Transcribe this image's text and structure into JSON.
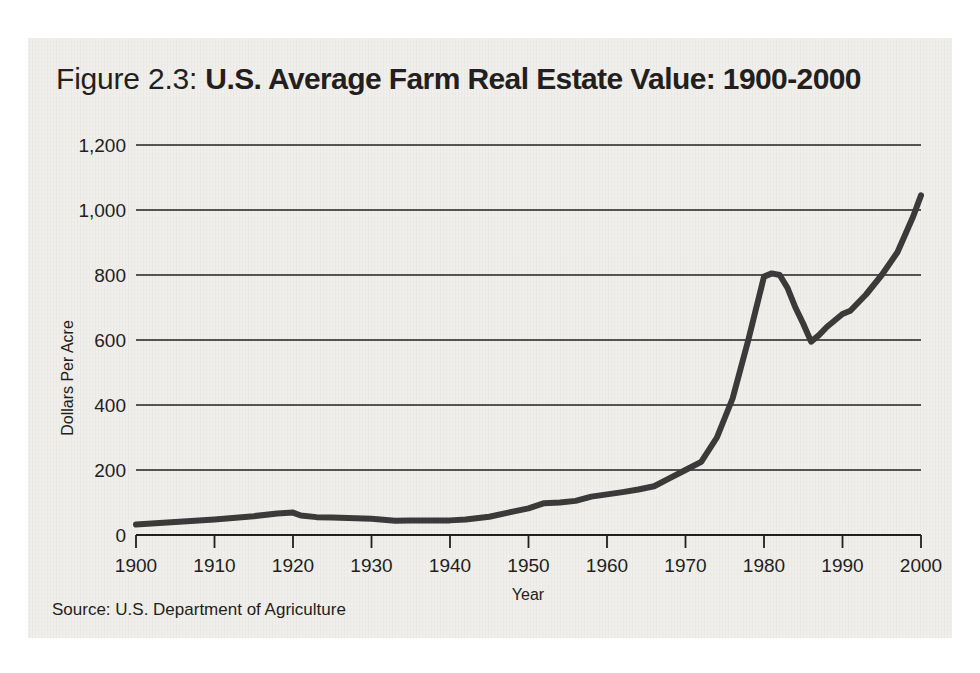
{
  "figure": {
    "number_label": "Figure 2.3:",
    "title": "U.S. Average Farm Real Estate Value: 1900-2000",
    "source": "Source: U.S. Department of Agriculture",
    "panel_color": "#eceae6",
    "line_color": "#3a3a3a",
    "text_color": "#231f20"
  },
  "chart_data": {
    "type": "line",
    "title": "U.S. Average Farm Real Estate Value: 1900-2000",
    "xlabel": "Year",
    "ylabel": "Dollars Per Acre",
    "xlim": [
      1900,
      2000
    ],
    "ylim": [
      0,
      1200
    ],
    "grid": true,
    "legend": "none",
    "xticks": [
      1900,
      1910,
      1920,
      1930,
      1940,
      1950,
      1960,
      1970,
      1980,
      1990,
      2000
    ],
    "xtick_labels": [
      "1900",
      "1910",
      "1920",
      "1930",
      "1940",
      "1950",
      "1960",
      "1970",
      "1980",
      "1990",
      "2000"
    ],
    "yticks": [
      0,
      200,
      400,
      600,
      800,
      1000,
      1200
    ],
    "ytick_labels": [
      "0",
      "200",
      "400",
      "600",
      "800",
      "1,000",
      "1,200"
    ],
    "series": [
      {
        "name": "Average farm real estate value per acre",
        "x": [
          1900,
          1905,
          1910,
          1915,
          1918,
          1920,
          1921,
          1923,
          1925,
          1930,
          1933,
          1935,
          1940,
          1942,
          1945,
          1948,
          1950,
          1952,
          1954,
          1956,
          1958,
          1960,
          1962,
          1964,
          1966,
          1968,
          1970,
          1972,
          1974,
          1976,
          1978,
          1980,
          1981,
          1982,
          1983,
          1984,
          1985,
          1986,
          1987,
          1988,
          1989,
          1990,
          1991,
          1993,
          1995,
          1997,
          1999,
          2000
        ],
        "y": [
          32,
          40,
          48,
          58,
          66,
          69,
          60,
          55,
          54,
          50,
          44,
          45,
          45,
          48,
          56,
          72,
          82,
          98,
          100,
          105,
          118,
          125,
          132,
          140,
          150,
          175,
          200,
          225,
          300,
          420,
          600,
          795,
          805,
          800,
          760,
          700,
          650,
          595,
          615,
          640,
          660,
          680,
          690,
          740,
          800,
          870,
          980,
          1045
        ]
      }
    ],
    "annotations": [
      {
        "label": "1920 post-WWI peak",
        "x": 1920,
        "y": 69
      },
      {
        "label": "Great Depression trough",
        "x": 1933,
        "y": 44
      },
      {
        "label": "1980-81 farm boom peak",
        "x": 1981,
        "y": 805
      },
      {
        "label": "1986 farm crisis trough",
        "x": 1986,
        "y": 595
      },
      {
        "label": "2000 value",
        "x": 2000,
        "y": 1045
      }
    ]
  }
}
